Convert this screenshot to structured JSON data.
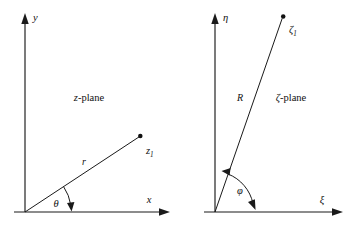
{
  "figure": {
    "type": "diagram",
    "panels": [
      {
        "id": "z-plane",
        "name": "z-plane",
        "plane_label": "z-plane",
        "plane_label_italic_part": "z",
        "plane_label_rest": "-plane",
        "vertical_axis_label": "y",
        "horizontal_axis_label": "x",
        "point_label": "z",
        "point_subscript": "1",
        "radius_label": "r",
        "angle_label": "θ",
        "angle_name": "theta",
        "origin": {
          "x": 25,
          "y": 212
        },
        "point": {
          "x": 140,
          "y": 136
        },
        "angle_degrees": 33,
        "arc_style": "single-headed"
      },
      {
        "id": "zeta-plane",
        "name": "ζ-plane",
        "plane_label": "ζ-plane",
        "plane_label_italic_part": "ζ",
        "plane_label_rest": "-plane",
        "vertical_axis_label": "η",
        "horizontal_axis_label": "ξ",
        "point_label": "ζ",
        "point_subscript": "1",
        "radius_label": "R",
        "angle_label": "φ",
        "angle_name": "phi",
        "origin": {
          "x": 215,
          "y": 212
        },
        "point": {
          "x": 283,
          "y": 17
        },
        "angle_degrees": 70,
        "arc_style": "double-headed"
      }
    ],
    "colors": {
      "stroke": "#1a1a1a",
      "text": "#101010",
      "background": "#ffffff"
    }
  }
}
